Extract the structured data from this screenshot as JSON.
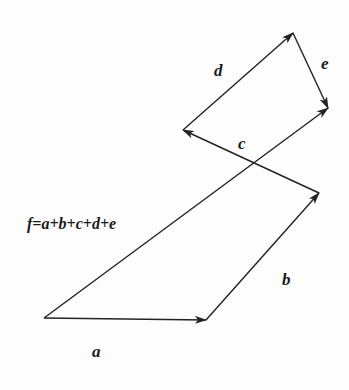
{
  "diagram": {
    "points": {
      "O": [
        44,
        318
      ],
      "A": [
        206,
        320
      ],
      "B": [
        319,
        193
      ],
      "C": [
        183,
        130
      ],
      "D": [
        293,
        33
      ],
      "E": [
        328,
        108
      ]
    },
    "vectors": [
      {
        "name": "a",
        "from": "O",
        "to": "A"
      },
      {
        "name": "b",
        "from": "A",
        "to": "B"
      },
      {
        "name": "c",
        "from": "B",
        "to": "C"
      },
      {
        "name": "d",
        "from": "C",
        "to": "D"
      },
      {
        "name": "e",
        "from": "D",
        "to": "E"
      },
      {
        "name": "f",
        "from": "O",
        "to": "E"
      }
    ],
    "labels": {
      "a": "a",
      "b": "b",
      "c": "c",
      "d": "d",
      "e": "e",
      "equation": "f=a+b+c+d+e"
    },
    "stroke_color": "#222222"
  }
}
